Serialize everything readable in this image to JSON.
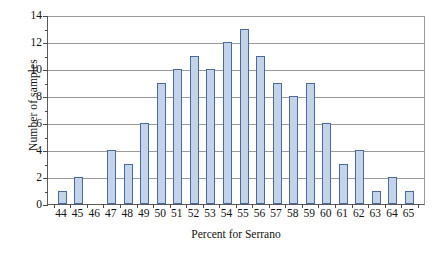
{
  "chart_data": {
    "type": "bar",
    "title": "",
    "xlabel": "Percent for Serrano",
    "ylabel": "Number of samples",
    "categories": [
      "44",
      "45",
      "46",
      "47",
      "48",
      "49",
      "50",
      "51",
      "52",
      "53",
      "54",
      "55",
      "56",
      "57",
      "58",
      "59",
      "60",
      "61",
      "62",
      "63",
      "64",
      "65"
    ],
    "values": [
      1,
      2,
      0,
      4,
      3,
      6,
      9,
      10,
      11,
      10,
      12,
      13,
      11,
      9,
      8,
      9,
      6,
      3,
      4,
      1,
      2,
      1
    ],
    "ylim": [
      0,
      14
    ],
    "ytick_major": [
      "0",
      "2",
      "4",
      "6",
      "8",
      "10",
      "12",
      "14"
    ],
    "ytick_major_values": [
      0,
      2,
      4,
      6,
      8,
      10,
      12,
      14
    ],
    "ytick_minor_values": [
      1,
      3,
      5,
      7,
      9,
      11,
      13
    ],
    "grid": "horizontal",
    "legend": "none",
    "bar_fill_color": "#c3d4ea",
    "bar_border_color": "#4a6a9c",
    "axis_color": "#5a5a5a",
    "gridline_color": "#9a9a9a"
  }
}
